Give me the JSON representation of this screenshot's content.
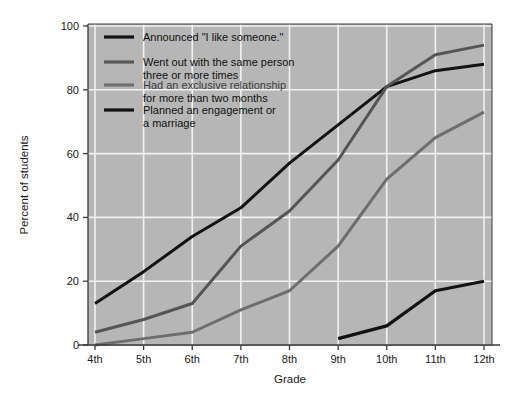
{
  "chart_data": {
    "type": "line",
    "title": "",
    "xlabel": "Grade",
    "ylabel": "Percent of students",
    "categories": [
      "4th",
      "5th",
      "6th",
      "7th",
      "8th",
      "9th",
      "10th",
      "11th",
      "12th"
    ],
    "xlim": [
      0,
      8
    ],
    "ylim": [
      0,
      100
    ],
    "yticks": [
      0,
      20,
      40,
      60,
      80,
      100
    ],
    "grid": true,
    "legend_position": "top-left",
    "series": [
      {
        "name": "Announced \"I like someone.\"",
        "color": "#121212",
        "width": 3.0,
        "values": [
          13,
          23,
          34,
          43,
          57,
          69,
          81,
          86,
          88
        ]
      },
      {
        "name": "Went out with the same person three or more times",
        "color": "#555555",
        "width": 3.0,
        "values": [
          4,
          8,
          13,
          31,
          42,
          58,
          81,
          91,
          94
        ]
      },
      {
        "name": "Had an exclusive relationship for more than two months",
        "color": "#6e6e6e",
        "width": 3.0,
        "values": [
          0,
          2,
          4,
          11,
          17,
          31,
          52,
          65,
          73
        ]
      },
      {
        "name": "Planned an engagement or a marriage",
        "color": "#121212",
        "width": 3.2,
        "values": [
          null,
          null,
          null,
          null,
          null,
          2,
          6,
          17,
          20
        ]
      }
    ]
  },
  "axes": {
    "y_tick_labels": [
      "0",
      "20",
      "40",
      "60",
      "80",
      "100"
    ],
    "x_tick_labels": [
      "4th",
      "5th",
      "6th",
      "7th",
      "8th",
      "9th",
      "10th",
      "11th",
      "12th"
    ],
    "y_axis_title": "Percent of students",
    "x_axis_title": "Grade"
  },
  "legend": {
    "entries": [
      {
        "label_line1": "Announced \"I like someone.\"",
        "label_line2": "",
        "swatch_color": "#121212"
      },
      {
        "label_line1": "Went out with the same person",
        "label_line2": "three or more times",
        "swatch_color": "#5a5a5a"
      },
      {
        "label_line1": "Had an exclusive relationship",
        "label_line2": "for more than two months",
        "swatch_color": "#707070"
      },
      {
        "label_line1": "Planned an engagement or",
        "label_line2": "a marriage",
        "swatch_color": "#121212"
      }
    ]
  },
  "style": {
    "plot_background": "#b6b6b6",
    "grid_color": "#f2f2f2",
    "page_background": "#ffffff",
    "axis_color": "#3a3a3a"
  }
}
